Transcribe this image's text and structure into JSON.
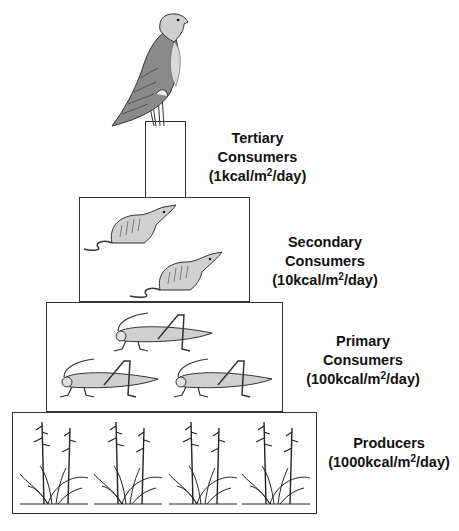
{
  "diagram": {
    "levels": [
      {
        "id": "tertiary",
        "name_line1": "Tertiary",
        "name_line2": "Consumers",
        "energy_prefix": "(1kcal/m",
        "energy_sup": "2",
        "energy_suffix": "/day)",
        "organism": "hawk",
        "count": 1
      },
      {
        "id": "secondary",
        "name_line1": "Secondary",
        "name_line2": "Consumers",
        "energy_prefix": "(10kcal/m",
        "energy_sup": "2",
        "energy_suffix": "/day)",
        "organism": "shrew",
        "count": 2
      },
      {
        "id": "primary",
        "name_line1": "Primary",
        "name_line2": "Consumers",
        "energy_prefix": "(100kcal/m",
        "energy_sup": "2",
        "energy_suffix": "/day)",
        "organism": "grasshopper",
        "count": 3
      },
      {
        "id": "producers",
        "name_line1": "Producers",
        "name_line2": "",
        "energy_prefix": "(1000kcal/m",
        "energy_sup": "2",
        "energy_suffix": "/day)",
        "organism": "grass-plant",
        "count": 4
      }
    ],
    "colors": {
      "outline": "#333333",
      "fill_gray": "#c8c8c8",
      "bird_gray": "#8a8a8a",
      "text": "#111111"
    }
  }
}
